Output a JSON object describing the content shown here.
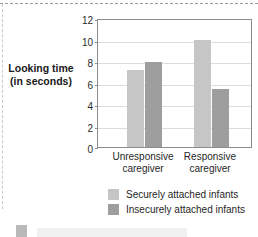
{
  "axis_title": {
    "line1": "Looking time",
    "line2": "(in seconds)"
  },
  "y_ticks": [
    "12",
    "10",
    "8",
    "6",
    "4",
    "2",
    "0"
  ],
  "categories": [
    {
      "line1": "Unresponsive",
      "line2": "caregiver"
    },
    {
      "line1": "Responsive",
      "line2": "caregiver"
    }
  ],
  "legend": {
    "items": [
      {
        "label": "Securely attached infants",
        "color": "#c6c6c6"
      },
      {
        "label": "Insecurely attached infants",
        "color": "#9e9e9e"
      }
    ]
  },
  "colors": {
    "secure": "#c6c6c6",
    "insecure": "#9e9e9e",
    "grid": "#dcdcdc",
    "frame": "#8c8c8c",
    "text": "#1f1f1f"
  },
  "chart_data": {
    "type": "bar",
    "title": "",
    "subtitle": "",
    "xlabel": "",
    "ylabel": "Looking time (in seconds)",
    "categories": [
      "Unresponsive caregiver",
      "Responsive caregiver"
    ],
    "series": [
      {
        "name": "Securely attached infants",
        "values": [
          7.2,
          10.0
        ],
        "color": "#c6c6c6"
      },
      {
        "name": "Insecurely attached infants",
        "values": [
          7.9,
          5.4
        ],
        "color": "#9e9e9e"
      }
    ],
    "ylim": [
      0,
      12
    ],
    "ytick_step": 2,
    "yticks": [
      0,
      2,
      4,
      6,
      8,
      10,
      12
    ],
    "grid": true,
    "legend_position": "bottom"
  }
}
